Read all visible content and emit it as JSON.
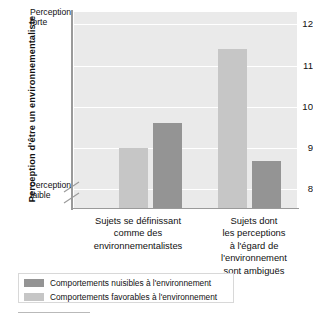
{
  "chart_data": {
    "type": "bar",
    "title": "",
    "subtitle": "",
    "xlabel": "",
    "ylabel": "Perception d'être un environnementaliste",
    "ylim": [
      7.55,
      12.3
    ],
    "yticks": [
      8,
      9,
      10,
      11,
      12
    ],
    "ytick_labels": [
      "8",
      "9",
      "10",
      "11",
      "12"
    ],
    "y_axis_top_note": "Perception forte",
    "y_axis_bottom_note": "Perception faible",
    "axis_break": true,
    "grid": true,
    "grid_axis": "y",
    "legend_position": "bottom-left",
    "categories": [
      "Sujets se définissant comme des environnementalistes",
      "Sujets dont les perceptions à l'égard de l'environnement sont ambiguës"
    ],
    "category_lines": [
      [
        "Sujets se définissant",
        "comme des",
        "environnementalistes"
      ],
      [
        "Sujets dont",
        "les perceptions",
        "à l'égard de",
        "l'environnement",
        "sont ambiguës"
      ]
    ],
    "series": [
      {
        "name": "Comportements favorables à l'environnement",
        "color": "#c6c6c6",
        "values": [
          9.0,
          11.4
        ]
      },
      {
        "name": "Comportements nuisibles à l'environnement",
        "color": "#949494",
        "values": [
          9.6,
          8.7
        ]
      }
    ],
    "bar_order_in_group": [
      "Comportements favorables à l'environnement",
      "Comportements nuisibles à l'environnement"
    ],
    "legend": [
      {
        "label": "Comportements nuisibles à l'environnement",
        "color": "#949494",
        "swatch": "dark"
      },
      {
        "label": "Comportements favorables à l'environnement",
        "color": "#c6c6c6",
        "swatch": "light"
      }
    ],
    "plot_background": "#eaeaea",
    "gridline_color": "#ffffff",
    "axis_color": "#9a9a9a"
  }
}
